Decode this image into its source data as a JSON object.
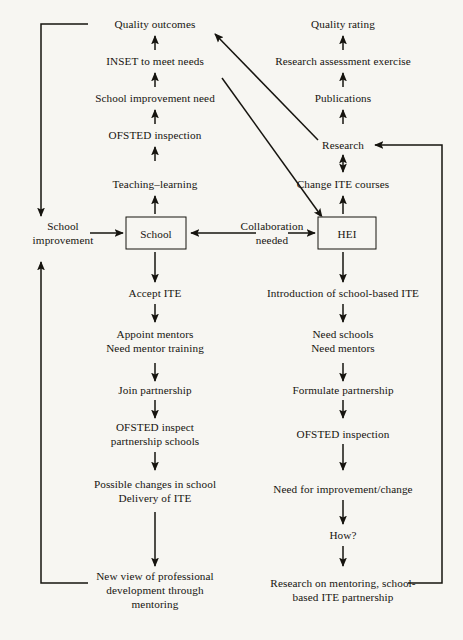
{
  "diagram": {
    "ink_color": "#16140f",
    "paper_color": "#f7f6f2",
    "nodes": {
      "quality_outcomes": "Quality outcomes",
      "inset": "INSET to meet needs",
      "school_improvement_need": "School improvement need",
      "ofsted_inspection_left": "OFSTED inspection",
      "teaching_learning": "Teaching–learning",
      "school_improvement_l1": "School",
      "school_improvement_l2": "improvement",
      "school_box": "School",
      "collaboration_l1": "Collaboration",
      "collaboration_l2": "needed",
      "hei_box": "HEI",
      "accept_ite": "Accept ITE",
      "appoint_mentors_l1": "Appoint mentors",
      "appoint_mentors_l2": "Need mentor training",
      "join_partnership": "Join partnership",
      "ofsted_inspect_l1": "OFSTED inspect",
      "ofsted_inspect_l2": "partnership schools",
      "possible_changes_l1": "Possible changes in school",
      "possible_changes_l2": "Delivery of ITE",
      "new_view_l1": "New view of professional",
      "new_view_l2": "development through",
      "new_view_l3": "mentoring",
      "quality_rating": "Quality rating",
      "rae": "Research assessment exercise",
      "publications": "Publications",
      "research": "Research",
      "change_ite": "Change ITE courses",
      "introduction_sbite": "Introduction of school-based ITE",
      "need_schools_l1": "Need schools",
      "need_schools_l2": "Need mentors",
      "formulate_partnership": "Formulate partnership",
      "ofsted_inspection_right": "OFSTED inspection",
      "need_improvement": "Need for improvement/change",
      "how": "How?",
      "research_on_mentoring_l1": "Research on mentoring, school-",
      "research_on_mentoring_l2": "based ITE partnership"
    }
  }
}
